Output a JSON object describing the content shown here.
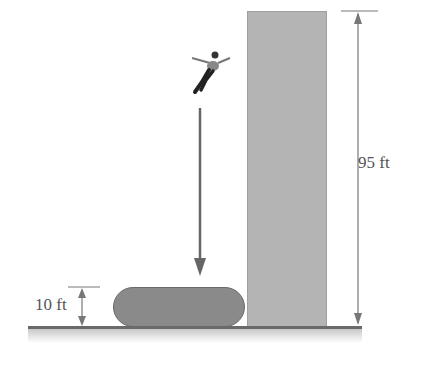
{
  "diagram": {
    "title": "",
    "labels": {
      "building_height": "95 ft",
      "airbag_height": "10 ft"
    },
    "elements": [
      "jumper figure",
      "fall arrow",
      "airbag",
      "building",
      "ground"
    ],
    "colors": {
      "building": "#b4b4b4",
      "airbag": "#8a8a8a",
      "ground": "#6a6a6a",
      "lines": "#777777"
    }
  }
}
